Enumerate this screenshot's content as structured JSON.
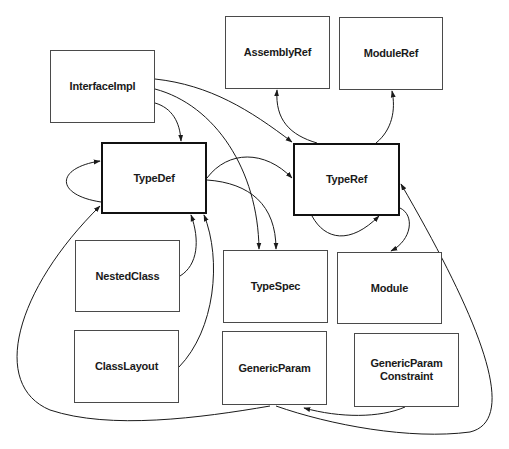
{
  "diagram": {
    "type": "metadata-table-relationships",
    "nodes": {
      "interfaceimpl": {
        "label": "InterfaceImpl",
        "x": 50,
        "y": 50,
        "w": 105,
        "h": 73,
        "emphasis": false
      },
      "assemblyref": {
        "label": "AssemblyRef",
        "x": 225,
        "y": 16,
        "w": 105,
        "h": 73,
        "emphasis": false
      },
      "moduleref": {
        "label": "ModuleRef",
        "x": 339,
        "y": 17,
        "w": 104,
        "h": 73,
        "emphasis": false
      },
      "typedef": {
        "label": "TypeDef",
        "x": 101,
        "y": 142,
        "w": 106,
        "h": 72,
        "emphasis": true
      },
      "typeref": {
        "label": "TypeRef",
        "x": 293,
        "y": 143,
        "w": 107,
        "h": 73,
        "emphasis": true
      },
      "nestedclass": {
        "label": "NestedClass",
        "x": 75,
        "y": 240,
        "w": 105,
        "h": 72,
        "emphasis": false
      },
      "typespec": {
        "label": "TypeSpec",
        "x": 223,
        "y": 250,
        "w": 105,
        "h": 73,
        "emphasis": false
      },
      "module": {
        "label": "Module",
        "x": 337,
        "y": 252,
        "w": 105,
        "h": 72,
        "emphasis": false
      },
      "classlayout": {
        "label": "ClassLayout",
        "x": 74,
        "y": 330,
        "w": 105,
        "h": 73,
        "emphasis": false
      },
      "genericparam": {
        "label": "GenericParam",
        "x": 222,
        "y": 331,
        "w": 105,
        "h": 74,
        "emphasis": false
      },
      "genericparamconstraint": {
        "label": "GenericParam\nConstraint",
        "x": 354,
        "y": 333,
        "w": 105,
        "h": 74,
        "emphasis": false
      }
    },
    "edges": [
      {
        "from": "InterfaceImpl",
        "to": "TypeDef"
      },
      {
        "from": "InterfaceImpl",
        "to": "TypeRef"
      },
      {
        "from": "InterfaceImpl",
        "to": "TypeSpec"
      },
      {
        "from": "TypeDef",
        "to": "TypeDef"
      },
      {
        "from": "TypeDef",
        "to": "TypeRef"
      },
      {
        "from": "TypeDef",
        "to": "TypeSpec"
      },
      {
        "from": "TypeRef",
        "to": "AssemblyRef"
      },
      {
        "from": "TypeRef",
        "to": "ModuleRef"
      },
      {
        "from": "TypeRef",
        "to": "TypeRef"
      },
      {
        "from": "TypeRef",
        "to": "Module"
      },
      {
        "from": "NestedClass",
        "to": "TypeDef"
      },
      {
        "from": "ClassLayout",
        "to": "TypeDef"
      },
      {
        "from": "GenericParam",
        "to": "TypeDef"
      },
      {
        "from": "GenericParam",
        "to": "TypeRef"
      },
      {
        "from": "GenericParamConstraint",
        "to": "GenericParam"
      }
    ]
  },
  "colors": {
    "line": "#1a1a1a",
    "box_border": "#4a4a4a",
    "background": "#ffffff"
  }
}
